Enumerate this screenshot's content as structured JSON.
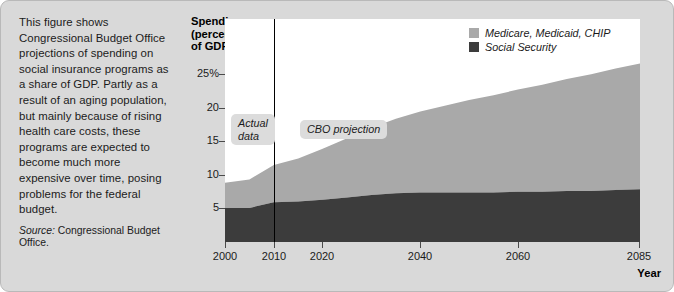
{
  "caption": {
    "body": "This figure shows Congressional Budget Office projections of spending on social insurance programs as a share of GDP. Partly as a result of an aging population, but mainly because of rising health care costs, these programs are expected to become much more expensive over time, posing problems for the federal budget.",
    "source_label": "Source:",
    "source_text": " Congressional Budget Office."
  },
  "annotations": {
    "actual": "Actual\ndata",
    "projection": "CBO projection"
  },
  "colors": {
    "medicare": "#a9a9a9",
    "social_security": "#3c3c3c",
    "plot_background": "#ffffff",
    "figure_background": "#d9d9d9",
    "divider": "#000000"
  },
  "chart_data": {
    "type": "area",
    "title": "Spending\n(percent\nof GDP)",
    "xlabel": "Year",
    "ylabel": "Spending (percent of GDP)",
    "stacked": true,
    "grid": false,
    "legend_position": "top-right",
    "xlim": [
      2000,
      2085
    ],
    "ylim": [
      0,
      27.5
    ],
    "xticks": [
      2000,
      2010,
      2020,
      2040,
      2060,
      2085
    ],
    "xticklabels": [
      "2000",
      "2010",
      "2020",
      "2040",
      "2060",
      "2085"
    ],
    "yticks": [
      5,
      10,
      15,
      20,
      25
    ],
    "yticklabels": [
      "5",
      "10",
      "15",
      "20",
      "25%"
    ],
    "divider_x": 2010,
    "x": [
      2000,
      2005,
      2010,
      2015,
      2020,
      2025,
      2030,
      2035,
      2040,
      2045,
      2050,
      2055,
      2060,
      2065,
      2070,
      2075,
      2080,
      2085
    ],
    "series": [
      {
        "name": "Social Security",
        "color": "#3c3c3c",
        "values": [
          4.2,
          4.2,
          4.9,
          5.0,
          5.2,
          5.5,
          5.8,
          6.0,
          6.1,
          6.1,
          6.1,
          6.1,
          6.2,
          6.2,
          6.3,
          6.3,
          6.4,
          6.5
        ]
      },
      {
        "name": "Medicare, Medicaid, CHIP",
        "color": "#a9a9a9",
        "values": [
          3.1,
          3.5,
          4.6,
          5.3,
          6.3,
          7.3,
          8.3,
          9.2,
          10.0,
          10.7,
          11.4,
          12.0,
          12.6,
          13.2,
          13.8,
          14.4,
          15.0,
          15.5
        ]
      }
    ],
    "totals": [
      7.3,
      7.7,
      9.5,
      10.3,
      11.5,
      12.8,
      14.1,
      15.2,
      16.1,
      16.8,
      17.5,
      18.1,
      18.8,
      19.4,
      20.1,
      20.7,
      21.4,
      22.0
    ]
  }
}
